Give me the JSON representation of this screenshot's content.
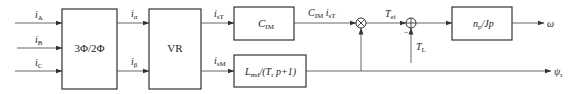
{
  "diagram": {
    "type": "block-diagram",
    "title": "",
    "blocks": [
      {
        "id": "transform",
        "label": "3Φ/2Φ"
      },
      {
        "id": "vr",
        "label": "VR"
      },
      {
        "id": "cim",
        "label_main": "C",
        "label_sub": "IM"
      },
      {
        "id": "lmd",
        "label_main": "L",
        "label_sub": "md",
        "label_rest": "/(T",
        "label_sub2": "r",
        "label_end": " p+1)"
      },
      {
        "id": "mech",
        "label_main": "n",
        "label_sub": "p",
        "label_rest": "/Jp"
      }
    ],
    "inputs": [
      {
        "main": "i",
        "sub": "A"
      },
      {
        "main": "i",
        "sub": "B"
      },
      {
        "main": "i",
        "sub": "C"
      }
    ],
    "signals": {
      "i_alpha": {
        "main": "i",
        "sub": "α"
      },
      "i_beta": {
        "main": "i",
        "sub": "β"
      },
      "i_sT": {
        "main": "i",
        "sub": "sT"
      },
      "i_sM": {
        "main": "i",
        "sub": "sM"
      },
      "cim_out": {
        "main": "C",
        "sub": "IM",
        "main2": " i",
        "sub2": "sT"
      },
      "Tei": {
        "main": "T",
        "sub": "ei"
      },
      "TL": {
        "main": "T",
        "sub": "L"
      },
      "minus": "−"
    },
    "outputs": {
      "omega": "ω",
      "psi": {
        "main": "ψ",
        "sub": "r"
      }
    },
    "junctions": [
      {
        "id": "multiplier",
        "symbol": "⊗"
      },
      {
        "id": "summer",
        "symbol": "⊕"
      }
    ]
  }
}
